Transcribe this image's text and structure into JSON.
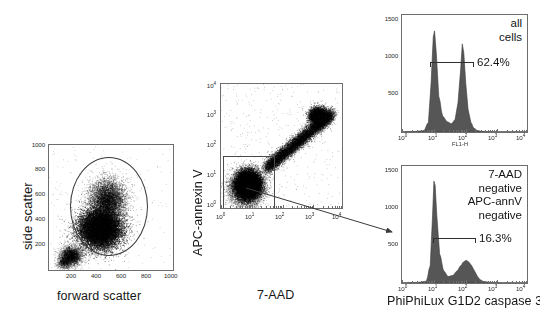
{
  "figure": {
    "background": "#ffffff",
    "hist_fill": "#565656",
    "axis_color": "#6d6d6d"
  },
  "panel_a": {
    "name": "forward-vs-side-scatter",
    "xlabel": "forward scatter",
    "ylabel": "side scatter",
    "xticks": [
      "200",
      "400",
      "600",
      "800",
      "1000"
    ],
    "yticks": [
      "1000",
      "800",
      "600",
      "400",
      "200"
    ],
    "gate_shape": "ellipse",
    "gate_label": ""
  },
  "panel_b": {
    "name": "7aad-vs-apc-annexinv",
    "xlabel": "7-AAD",
    "ylabel": "APC-annexin V",
    "xticks": [
      "10",
      "10",
      "10",
      "10",
      "10"
    ],
    "xtick_exponents": [
      "0",
      "1",
      "2",
      "3",
      "4"
    ],
    "yticks": [
      "10",
      "10",
      "10",
      "10",
      "10"
    ],
    "ytick_exponents": [
      "0",
      "1",
      "2",
      "3",
      "4"
    ],
    "gate_shape": "rectangle",
    "gate_label": ""
  },
  "panel_c": {
    "name": "all-cells-histogram",
    "note": "all\ncells",
    "note_line1": "all",
    "note_line2": "cells",
    "percent": "62.4%",
    "xlabel": "FL1-H",
    "xticks": [
      "10",
      "10",
      "10",
      "10",
      "10"
    ],
    "xtick_exponents": [
      "0",
      "1",
      "2",
      "3",
      "4"
    ],
    "yticks": [
      "1500",
      "1000",
      "500"
    ]
  },
  "panel_d": {
    "name": "double-negative-histogram",
    "note_line1": "7-AAD",
    "note_line2": "negative",
    "note_line3": "APC-annV",
    "note_line4": "negative",
    "percent": "16.3%",
    "xlabel": "PhiPhiLux G1D2 caspase 3",
    "xticks": [
      "10",
      "10",
      "10",
      "10",
      "10"
    ],
    "xtick_exponents": [
      "0",
      "1",
      "2",
      "3",
      "4"
    ],
    "yticks": [
      "1500",
      "1000",
      "500"
    ]
  },
  "chart_data": [
    {
      "type": "scatter",
      "panel": "A",
      "title": "",
      "xlabel": "forward scatter",
      "ylabel": "side scatter",
      "xlim": [
        0,
        1000
      ],
      "ylim": [
        0,
        1000
      ],
      "xticks": [
        200,
        400,
        600,
        800,
        1000
      ],
      "yticks": [
        200,
        400,
        600,
        800,
        1000
      ],
      "grid": false,
      "scale": "linear",
      "gate": {
        "type": "ellipse",
        "center_x": 440,
        "center_y": 470,
        "width_x": 560,
        "height_y": 720,
        "label": ""
      },
      "population_description": "Single dense lymphocyte/monocyte cloud centered near FSC 400, SSC 330 with a tail extending to low FSC/low SSC debris.",
      "clusters": [
        {
          "cx": 410,
          "cy": 330,
          "rx": 200,
          "ry": 180,
          "density": "very high"
        },
        {
          "cx": 470,
          "cy": 560,
          "rx": 170,
          "ry": 200,
          "density": "medium"
        },
        {
          "cx": 180,
          "cy": 120,
          "rx": 110,
          "ry": 90,
          "density": "low"
        }
      ]
    },
    {
      "type": "scatter",
      "panel": "B",
      "title": "",
      "xlabel": "7-AAD",
      "ylabel": "APC-annexin V",
      "xlim": [
        1,
        10000
      ],
      "ylim": [
        1,
        10000
      ],
      "xticks": [
        1,
        10,
        100,
        1000,
        10000
      ],
      "yticks": [
        1,
        10,
        100,
        1000,
        10000
      ],
      "grid": false,
      "scale": "log",
      "gate": {
        "type": "rectangle",
        "x_min": 1,
        "x_max": 45,
        "y_min": 1,
        "y_max": 32,
        "label": "7-AAD negative / APC-annV negative"
      },
      "population_description": "Double-negative cluster at low 7-AAD and low annexin V plus a diagonal double-positive apoptotic/dead streak rising to high 7-AAD, high annexin V.",
      "clusters": [
        {
          "cx": 8,
          "cy": 6,
          "label": "double negative",
          "density": "very high"
        },
        {
          "cx": 1300,
          "cy": 900,
          "label": "double positive",
          "density": "high"
        }
      ]
    },
    {
      "type": "line",
      "subtype": "histogram",
      "panel": "C",
      "title": "all cells",
      "xlabel": "FL1-H",
      "ylabel": "",
      "xlim": [
        1,
        10000
      ],
      "ylim": [
        0,
        1700
      ],
      "xticks": [
        1,
        10,
        100,
        1000,
        10000
      ],
      "yticks": [
        500,
        1000,
        1500
      ],
      "scale": "log",
      "grid": false,
      "fill": "#565656",
      "marker": {
        "label": "62.4%",
        "x_min": 25,
        "x_max": 260
      },
      "peaks": [
        {
          "center": 11,
          "height": 1470,
          "label": "negative peak"
        },
        {
          "center": 85,
          "height": 1280,
          "label": "positive peak"
        }
      ],
      "bins_x": [
        1,
        2.5,
        5,
        7,
        8.5,
        10,
        11,
        12.5,
        15,
        20,
        28,
        38,
        50,
        62,
        75,
        85,
        95,
        110,
        130,
        160,
        200,
        260,
        350,
        600,
        1200,
        10000
      ],
      "bins_y": [
        5,
        8,
        20,
        140,
        700,
        1380,
        1470,
        1150,
        520,
        230,
        150,
        120,
        180,
        430,
        900,
        1280,
        1150,
        700,
        330,
        140,
        55,
        22,
        10,
        6,
        4,
        3
      ]
    },
    {
      "type": "line",
      "subtype": "histogram",
      "panel": "D",
      "title": "7-AAD negative APC-annV negative",
      "xlabel": "PhiPhiLux G1D2 caspase 3",
      "ylabel": "",
      "xlim": [
        1,
        10000
      ],
      "ylim": [
        0,
        1700
      ],
      "xticks": [
        1,
        10,
        100,
        1000,
        10000
      ],
      "yticks": [
        500,
        1000,
        1500
      ],
      "scale": "log",
      "grid": false,
      "fill": "#565656",
      "marker": {
        "label": "16.3%",
        "x_min": 28,
        "x_max": 300
      },
      "peaks": [
        {
          "center": 11,
          "height": 1480,
          "label": "negative peak"
        },
        {
          "center": 110,
          "height": 330,
          "label": "caspase-3 positive shoulder"
        }
      ],
      "bins_x": [
        1,
        3,
        6,
        8,
        9.5,
        10.5,
        11.5,
        13,
        16,
        22,
        30,
        42,
        58,
        75,
        95,
        115,
        140,
        170,
        210,
        260,
        320,
        420,
        700,
        1500,
        10000
      ],
      "bins_y": [
        4,
        8,
        25,
        250,
        980,
        1480,
        1420,
        980,
        420,
        170,
        95,
        110,
        175,
        250,
        310,
        330,
        300,
        250,
        175,
        95,
        45,
        20,
        9,
        5,
        3
      ]
    }
  ]
}
